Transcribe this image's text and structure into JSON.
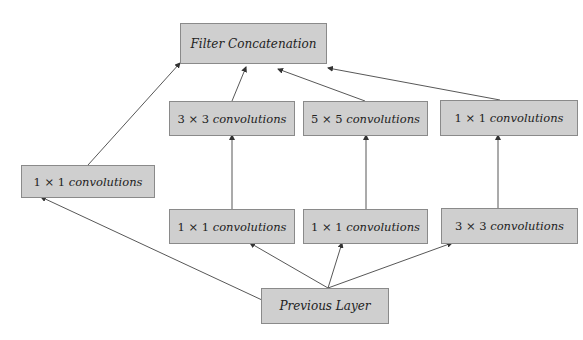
{
  "diagram": {
    "colors": {
      "box_fill": "#cfcfcf",
      "box_border": "#8a8a8a",
      "arrow": "#333333",
      "text": "#222222"
    },
    "nodes": {
      "filter_concat": {
        "label": "Filter Concatenation"
      },
      "pool_proj_1x1": {
        "size": "1 × 1",
        "label": "convolutions"
      },
      "conv3x3": {
        "size": "3 × 3",
        "label": "convolutions"
      },
      "conv5x5": {
        "size": "5 × 5",
        "label": "convolutions"
      },
      "conv1x1_top": {
        "size": "1 × 1",
        "label": "convolutions"
      },
      "reduce1x1_a": {
        "size": "1 × 1",
        "label": "convolutions"
      },
      "reduce1x1_b": {
        "size": "1 × 1",
        "label": "convolutions"
      },
      "pool3x3": {
        "size": "3 × 3",
        "label": "convolutions"
      },
      "previous_layer": {
        "label": "Previous Layer"
      }
    },
    "edges": [
      {
        "from": "previous_layer",
        "to": "pool_proj_1x1"
      },
      {
        "from": "previous_layer",
        "to": "reduce1x1_a"
      },
      {
        "from": "previous_layer",
        "to": "reduce1x1_b"
      },
      {
        "from": "previous_layer",
        "to": "pool3x3"
      },
      {
        "from": "reduce1x1_a",
        "to": "conv3x3"
      },
      {
        "from": "reduce1x1_b",
        "to": "conv5x5"
      },
      {
        "from": "pool3x3",
        "to": "conv1x1_top"
      },
      {
        "from": "pool_proj_1x1",
        "to": "filter_concat"
      },
      {
        "from": "conv3x3",
        "to": "filter_concat"
      },
      {
        "from": "conv5x5",
        "to": "filter_concat"
      },
      {
        "from": "conv1x1_top",
        "to": "filter_concat"
      }
    ]
  }
}
